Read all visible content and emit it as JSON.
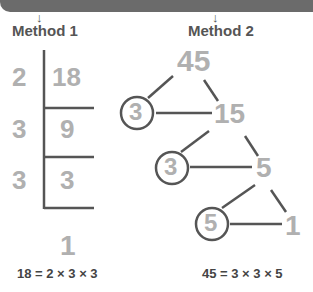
{
  "header": {
    "arrow_glyph": "↓"
  },
  "method1": {
    "title": "Method 1",
    "divisors": [
      "2",
      "3",
      "3"
    ],
    "dividends": [
      "18",
      "9",
      "3"
    ],
    "remainder": "1",
    "equation": "18 = 2 × 3 × 3"
  },
  "method2": {
    "title": "Method 2",
    "nodes": {
      "root": "45",
      "l1": "15",
      "l2": "5",
      "l3": "1"
    },
    "primes": [
      "3",
      "3",
      "5"
    ],
    "equation": "45 = 3 × 3 × 5"
  },
  "colors": {
    "line": "#555555",
    "number": "#b0b0b0",
    "text": "#555555"
  }
}
